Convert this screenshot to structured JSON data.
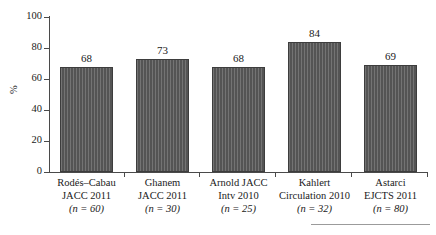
{
  "chart_data": {
    "type": "bar",
    "title": "",
    "subtitle": "",
    "xlabel": "",
    "ylabel": "%",
    "ylim": [
      0,
      100
    ],
    "yticks": [
      0,
      20,
      40,
      60,
      80,
      100
    ],
    "ytick_labels": [
      "0",
      "20",
      "40",
      "60",
      "80",
      "100"
    ],
    "grid": false,
    "legend": "none",
    "categories": [
      "Rodés–Cabau JACC 2011 (n = 60)",
      "Ghanem JACC 2011 (n = 30)",
      "Arnold JACC Intv 2010 (n = 25)",
      "Kahlert Circulation 2010 (n = 32)",
      "Astarci EJCTS 2011 (n = 80)"
    ],
    "values": [
      68,
      73,
      68,
      84,
      69
    ],
    "value_labels": [
      "68",
      "73",
      "68",
      "84",
      "69"
    ],
    "bars": [
      {
        "value": 68,
        "value_label": "68",
        "author": "Rodés–Cabau",
        "source": "JACC 2011",
        "n_label": "(n = 60)",
        "n": 60
      },
      {
        "value": 73,
        "value_label": "73",
        "author": "Ghanem",
        "source": "JACC 2011",
        "n_label": "(n = 30)",
        "n": 30
      },
      {
        "value": 68,
        "value_label": "68",
        "author": "Arnold JACC",
        "source": "Intv 2010",
        "n_label": "(n = 25)",
        "n": 25
      },
      {
        "value": 84,
        "value_label": "84",
        "author": "Kahlert",
        "source": "Circulation 2010",
        "n_label": "(n = 32)",
        "n": 32
      },
      {
        "value": 69,
        "value_label": "69",
        "author": "Astarci",
        "source": "EJCTS 2011",
        "n_label": "(n = 80)",
        "n": 80
      }
    ],
    "colors": {
      "bar_fill": "#595959",
      "bar_edge": "#3d3d3d",
      "axis": "#4a4a4a",
      "text": "#1a1a1a",
      "footer_rule": "#9b9b9b",
      "background": "#ffffff"
    }
  }
}
